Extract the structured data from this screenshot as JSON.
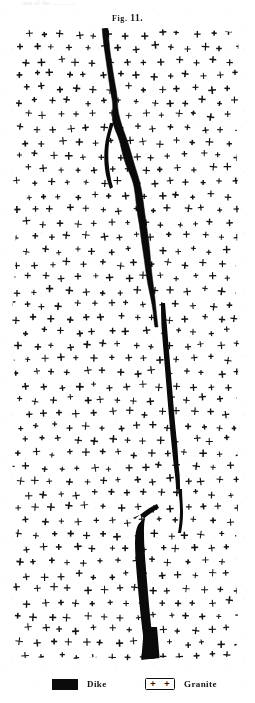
{
  "page": {
    "top_remnant_text": "ture  of  the  .....   ....  ..",
    "background_color": "#ffffff",
    "ink_color": "#111111"
  },
  "figure": {
    "caption_prefix": "Fig.",
    "caption_number": "11.",
    "caption_full": "Fig. 11."
  },
  "legend": {
    "entries": [
      {
        "key": "dike",
        "label": "Dike",
        "swatch_type": "solid-black-rectangle",
        "swatch_color": "#0b0b0b"
      },
      {
        "key": "granite",
        "label": "Granite",
        "swatch_type": "outlined-rectangle-with-plus-marks",
        "swatch_color": "#ffffff",
        "swatch_border_color": "#111111",
        "swatch_marks": [
          "+",
          "+"
        ]
      }
    ]
  },
  "illustration": {
    "type": "geological-cross-section",
    "subject": "dike intruding granite",
    "granite_symbol": "+",
    "granite_plus_rows": 47,
    "granite_plus_per_row": 14,
    "dike_color": "#0a0a0a",
    "plate_width": 235,
    "plate_height": 636
  }
}
